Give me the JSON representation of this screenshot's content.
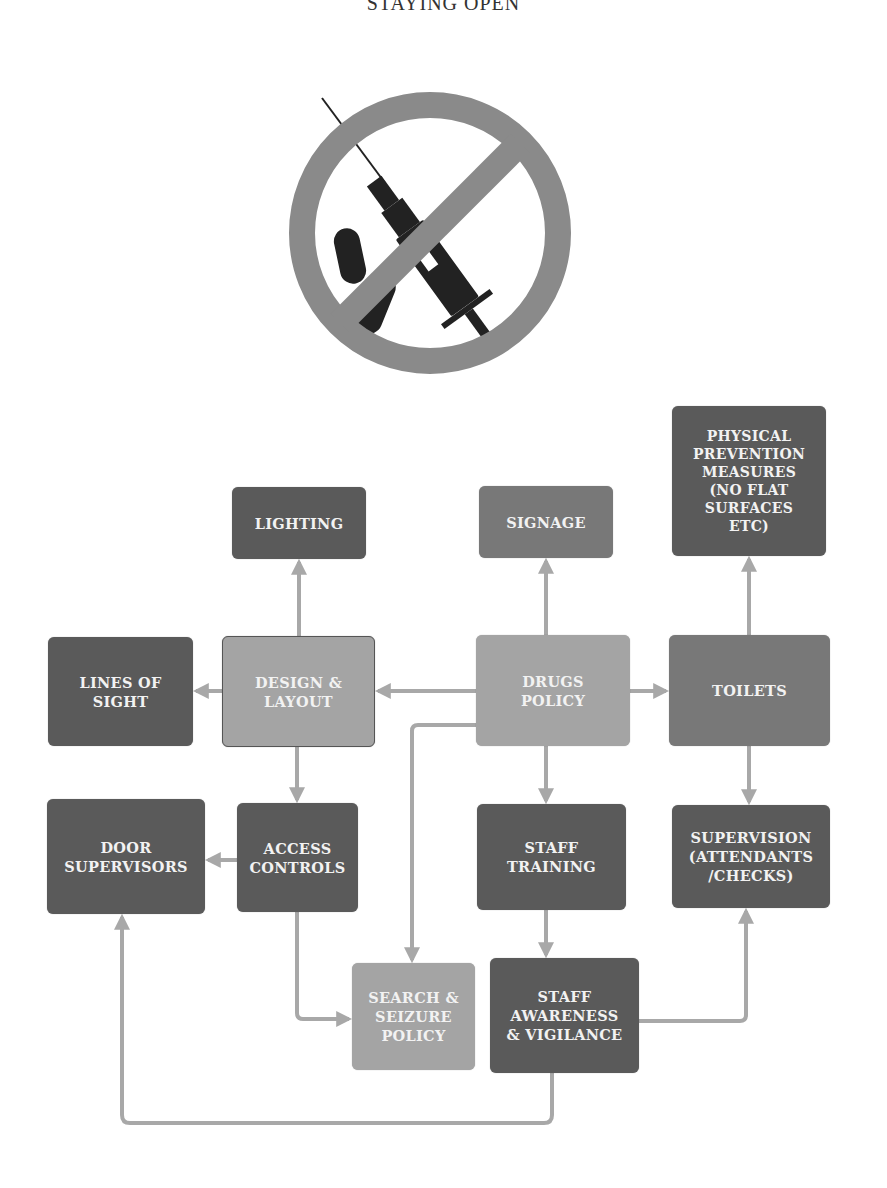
{
  "page": {
    "title": "STAYING OPEN"
  },
  "icon": {
    "name": "no-drugs-prohibition-icon",
    "description": "Prohibition sign over syringe and capsules"
  },
  "colors": {
    "dark_box": "#5a5a5a",
    "mid_box": "#787878",
    "light_box": "#a4a4a4",
    "connector": "#a8a8a8",
    "prohibition": "#8a8a8a",
    "glyph": "#222222"
  },
  "diagram": {
    "nodes": {
      "lighting": {
        "label": "LIGHTING"
      },
      "signage": {
        "label": "SIGNAGE"
      },
      "physical_prevention": {
        "label": "PHYSICAL\nPREVENTION\nMEASURES\n(NO FLAT\nSURFACES\nETC)"
      },
      "lines_of_sight": {
        "label": "LINES OF\nSIGHT"
      },
      "design_layout": {
        "label": "DESIGN &\nLAYOUT"
      },
      "drugs_policy": {
        "label": "DRUGS\nPOLICY"
      },
      "toilets": {
        "label": "TOILETS"
      },
      "door_supervisors": {
        "label": "DOOR\nSUPERVISORS"
      },
      "access_controls": {
        "label": "ACCESS\nCONTROLS"
      },
      "staff_training": {
        "label": "STAFF\nTRAINING"
      },
      "supervision": {
        "label": "SUPERVISION\n(ATTENDANTS\n/CHECKS)"
      },
      "search_seizure": {
        "label": "SEARCH &\nSEIZURE\nPOLICY"
      },
      "staff_awareness": {
        "label": "STAFF\nAWARENESS\n& VIGILANCE"
      }
    },
    "edges": [
      {
        "from": "DRUGS POLICY",
        "to": "DESIGN & LAYOUT"
      },
      {
        "from": "DRUGS POLICY",
        "to": "SIGNAGE"
      },
      {
        "from": "DRUGS POLICY",
        "to": "TOILETS"
      },
      {
        "from": "DRUGS POLICY",
        "to": "STAFF TRAINING"
      },
      {
        "from": "DRUGS POLICY",
        "to": "SEARCH & SEIZURE POLICY"
      },
      {
        "from": "DESIGN & LAYOUT",
        "to": "LIGHTING"
      },
      {
        "from": "DESIGN & LAYOUT",
        "to": "LINES OF SIGHT"
      },
      {
        "from": "DESIGN & LAYOUT",
        "to": "ACCESS CONTROLS"
      },
      {
        "from": "TOILETS",
        "to": "PHYSICAL PREVENTION MEASURES (NO FLAT SURFACES ETC)"
      },
      {
        "from": "TOILETS",
        "to": "SUPERVISION (ATTENDANTS /CHECKS)"
      },
      {
        "from": "ACCESS CONTROLS",
        "to": "DOOR SUPERVISORS"
      },
      {
        "from": "ACCESS CONTROLS",
        "to": "SEARCH & SEIZURE POLICY"
      },
      {
        "from": "STAFF TRAINING",
        "to": "STAFF AWARENESS & VIGILANCE"
      },
      {
        "from": "STAFF AWARENESS & VIGILANCE",
        "to": "SUPERVISION (ATTENDANTS /CHECKS)"
      },
      {
        "from": "STAFF AWARENESS & VIGILANCE",
        "to": "DOOR SUPERVISORS"
      }
    ]
  }
}
